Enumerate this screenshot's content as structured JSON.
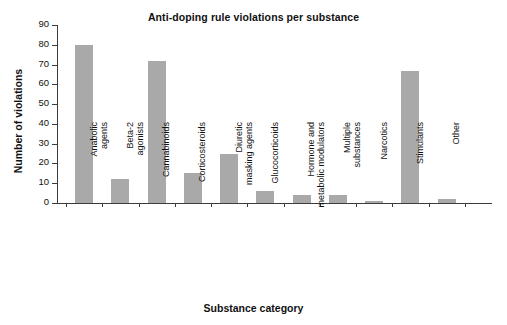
{
  "chart_data": {
    "type": "bar",
    "title": "Anti-doping rule violations per substance",
    "xlabel": "Substance category",
    "ylabel": "Number of violations",
    "ylim": [
      0,
      90
    ],
    "ytick_values": [
      0,
      10,
      20,
      30,
      40,
      50,
      60,
      70,
      80,
      90
    ],
    "ytick_labels": [
      "0",
      "10",
      "20",
      "30",
      "40",
      "50",
      "60",
      "70",
      "80",
      "90"
    ],
    "grid": false,
    "legend": null,
    "bar_color": "#a9a9a9",
    "axis_color": "#3c3c3c",
    "categories": [
      "Anabolic\nagents",
      "Beta-2\nagonists",
      "Cannabinoids",
      "Corticosteroids",
      "Diuretic\nmasking agents",
      "Glucocorticoids",
      "Hormone and\nmetabolic modulators",
      "Multiple\nsubstances",
      "Narcotics",
      "Stimulants",
      "Other"
    ],
    "values": [
      80,
      12,
      72,
      15,
      25,
      6,
      4,
      4,
      1,
      67,
      2
    ]
  }
}
